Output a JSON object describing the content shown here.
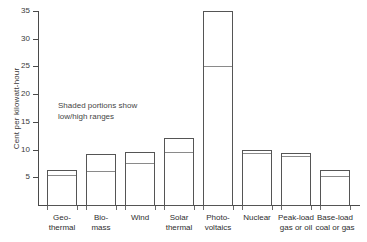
{
  "chart_data": {
    "type": "bar",
    "title": "",
    "subtitle": "",
    "xlabel": "",
    "ylabel": "Cent per kilowatt-hour",
    "ylim": [
      0,
      35
    ],
    "ytick_values": [
      0,
      5,
      10,
      15,
      20,
      25,
      30,
      35
    ],
    "ytick_labels": [
      "",
      "5",
      "10",
      "15",
      "20",
      "25",
      "30",
      "35"
    ],
    "grid": false,
    "legend": null,
    "annotations": [
      {
        "text": "Shaded portions show\nlow/high ranges",
        "x_unit_hint": 2.1,
        "y_unit_hint": 16
      }
    ],
    "categories": [
      "Geo-\nthermal",
      "Bio-\nmass",
      "Wind",
      "Solar\nthermal",
      "Photo-\nvoltaics",
      "Nuclear",
      "Peak-load\ngas or oil",
      "Base-load\ncoal or gas"
    ],
    "series": [
      {
        "name": "low",
        "description": "Bottom of shaded range (solid portion of bar)",
        "values": [
          5.5,
          6.2,
          7.5,
          9.5,
          25.0,
          9.3,
          8.8,
          5.2
        ]
      },
      {
        "name": "high",
        "description": "Top of bar (high end of range)",
        "values": [
          6.3,
          9.2,
          9.5,
          12.0,
          35.0,
          10.0,
          9.3,
          6.3
        ]
      }
    ]
  },
  "axis": {
    "y_label": "Cent per kilowatt-hour"
  },
  "note": {
    "line1": "Shaded portions show",
    "line2": "low/high ranges"
  },
  "colors": {
    "bar_stroke": "#555555",
    "divider": "#8a8a8a",
    "axis": "#4a4a4a",
    "background": "#ffffff",
    "text": "#2e2e2e"
  }
}
